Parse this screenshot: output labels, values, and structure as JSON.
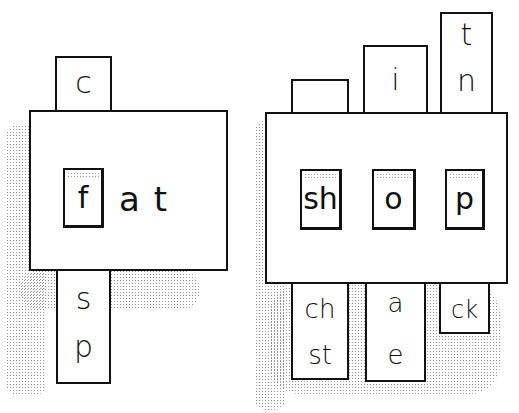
{
  "left_card": {
    "top_strip": [
      "c"
    ],
    "window_letter": "f",
    "rest_text": "at",
    "bottom_strip": [
      "s",
      "p"
    ]
  },
  "right_card": {
    "top_strips": [
      {
        "letters": []
      },
      {
        "letters": [
          "i"
        ]
      },
      {
        "letters": [
          "t",
          "n"
        ]
      }
    ],
    "windows": [
      "sh",
      "o",
      "p"
    ],
    "bottom_strips": [
      {
        "letters": [
          "ch",
          "st"
        ]
      },
      {
        "letters": [
          "a",
          "e"
        ]
      },
      {
        "letters": [
          "ck"
        ]
      }
    ]
  },
  "colors": {
    "ink": "#111111",
    "paper": "#ffffff",
    "shading": "#666666"
  }
}
